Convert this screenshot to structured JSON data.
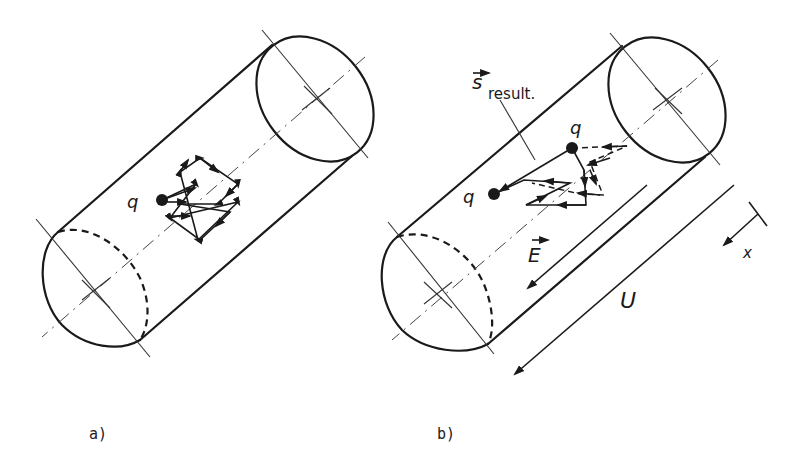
{
  "figure": {
    "panels": [
      {
        "id": "a",
        "caption": "a)",
        "charge_label": "q",
        "description": "Cylinder with charge q undergoing random thermal motion (zig-zag path) with no net displacement"
      },
      {
        "id": "b",
        "caption": "b)",
        "charge_label_start": "q",
        "charge_label_end": "q",
        "resultant_label_main": "s",
        "resultant_label_sub": "result.",
        "field_label": "E",
        "voltage_label": "U",
        "axis_label": "x",
        "description": "Cylinder with applied field E and voltage U; charge q drifts with resultant displacement s_result."
      }
    ]
  }
}
